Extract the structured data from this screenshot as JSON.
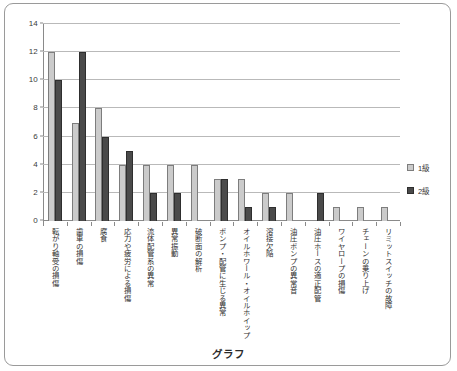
{
  "chart_data": {
    "type": "bar",
    "title": "グラフ",
    "xlabel": "",
    "ylabel": "",
    "ylim": [
      0,
      14
    ],
    "ytick_step": 2,
    "yticks": [
      0,
      2,
      4,
      6,
      8,
      10,
      12,
      14
    ],
    "grid": true,
    "legend_position": "right",
    "categories": [
      "転がり軸受の損傷",
      "歯車の損傷",
      "腐食",
      "応力や疲労による損傷",
      "流体配管系の異常",
      "異常振動",
      "破断面の解析",
      "ポンプ・配管に生じる異常",
      "オイルホワール・オイルホイップ",
      "溶接欠陥",
      "油圧ポンプの異常音",
      "油圧ホースの適正配管",
      "ワイヤロープの損傷",
      "チェーンの乗り上げ",
      "リミットスイッチの故障"
    ],
    "series": [
      {
        "name": "1級",
        "color": "#cbcbcb",
        "values": [
          12,
          7,
          8,
          4,
          4,
          4,
          4,
          3,
          3,
          2,
          2,
          0,
          1,
          1,
          1
        ]
      },
      {
        "name": "2級",
        "color": "#4a4a4a",
        "values": [
          10,
          12,
          6,
          5,
          2,
          2,
          0,
          3,
          1,
          1,
          0,
          2,
          0,
          0,
          0
        ]
      }
    ]
  },
  "legend": {
    "items": [
      {
        "label": "1級",
        "swatch": "light-gray-square"
      },
      {
        "label": "2級",
        "swatch": "dark-gray-square"
      }
    ]
  },
  "axis": {
    "y_labels": [
      "0",
      "2",
      "4",
      "6",
      "8",
      "10",
      "12",
      "14"
    ]
  }
}
